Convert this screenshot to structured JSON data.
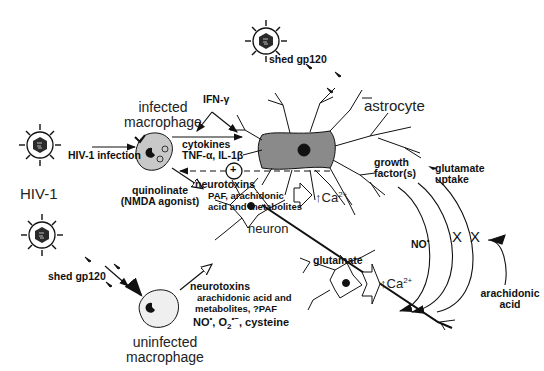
{
  "diagram": {
    "virus_label": "HIV-1",
    "infection_arrow_label": "HIV-1 infection",
    "infected_macrophage": {
      "line1": "infected",
      "line2": "macrophage"
    },
    "uninfected_macrophage": {
      "line1": "uninfected",
      "line2": "macrophage"
    },
    "astrocyte_label": "astrocyte",
    "neuron_label": "neuron",
    "ifn_label": "IFN-γ",
    "cytokines": {
      "line1": "cytokines",
      "line2": "TNF-α, IL-1β"
    },
    "plus_symbol": "+",
    "quinolinate": {
      "line1": "quinolinate",
      "line2": "(NMDA agonist)"
    },
    "neurotoxins_top": {
      "title": "neurotoxins",
      "line1": "PAF, arachidonic",
      "line2": "acid and metabolites"
    },
    "neurotoxins_bottom": {
      "title": "neurotoxins",
      "line1": "arachidonic acid and",
      "line2": "metabolites, ?PAF",
      "line3_a": "NO",
      "line3_dot": "•",
      "line3_b": ", O",
      "line3_sub": "2",
      "line3_sup": "•−",
      "line3_c": ", cysteine"
    },
    "shed_gp120_top": "shed gp120",
    "shed_gp120_bottom": "shed gp120",
    "ca_upper": {
      "arrow": "↑",
      "text": "Ca",
      "sup": "2+"
    },
    "ca_lower": {
      "arrow": "↑",
      "text": "Ca",
      "sup": "2+"
    },
    "glutamate_label": "glutamate",
    "growth_factors": {
      "line1": "growth",
      "line2": "factor(s)"
    },
    "glutamate_uptake": {
      "line1": "glutamate",
      "line2": "uptake"
    },
    "no_label": {
      "text": "NO",
      "sup": "•"
    },
    "arachidonic_acid": {
      "line1": "arachidonic",
      "line2": "acid"
    },
    "block_marks": [
      "X",
      "X"
    ]
  },
  "colors": {
    "ink": "#111111",
    "astrocyte_fill": "#8a8a8a",
    "infected_fill": "#c8c8c8",
    "uninfected_fill": "#efefef",
    "virus_core": "#2a2a2a"
  }
}
